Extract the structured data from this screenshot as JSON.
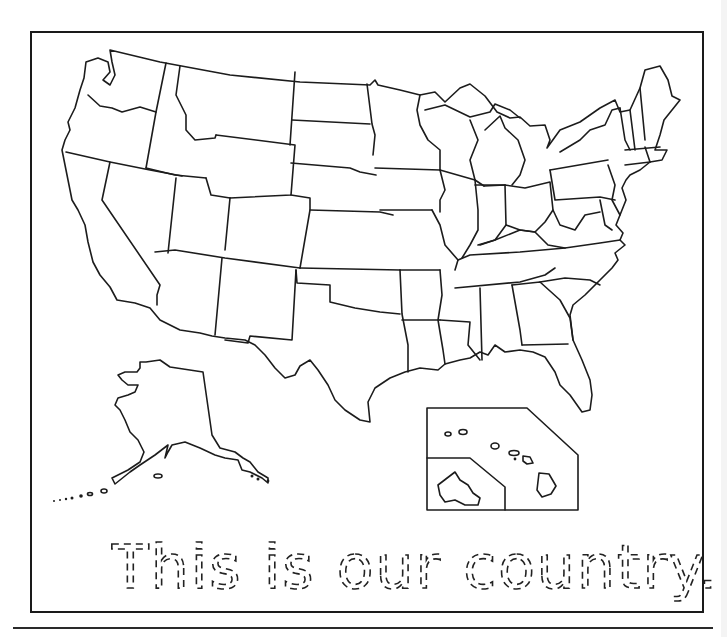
{
  "worksheet": {
    "title": "This is our country.",
    "type": "tracing-worksheet",
    "text_style": "dashed-tracing-letters"
  },
  "map": {
    "subject": "United States outline map",
    "regions": [
      "contiguous-us",
      "alaska-inset",
      "hawaii-inset"
    ],
    "hawaii_inset": {
      "islands": 8,
      "sub_inset": "oahu"
    },
    "line_color": "#1c1c1c",
    "fill_color": "#ffffff"
  },
  "colors": {
    "background": "#ffffff",
    "ink": "#1c1c1c"
  }
}
